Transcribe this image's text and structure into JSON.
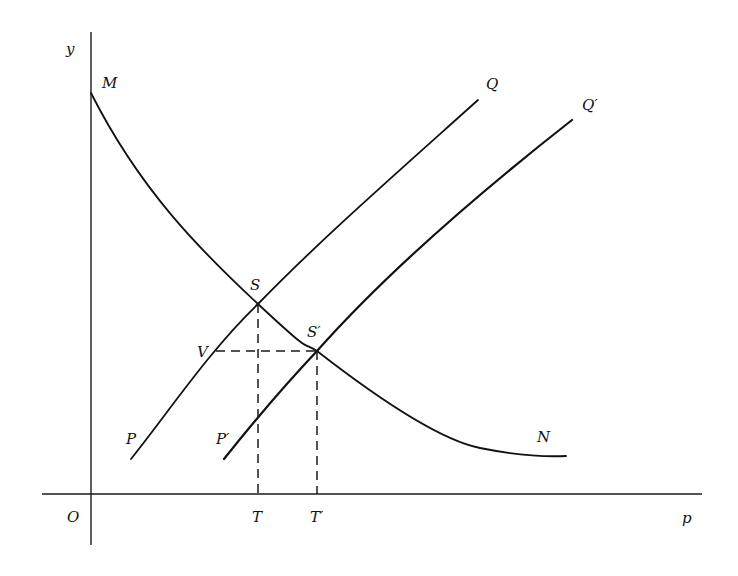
{
  "diagram": {
    "type": "supply-demand shift diagram",
    "axes": {
      "y_label": "y",
      "x_label": "p",
      "origin_label": "O"
    },
    "curves": {
      "demand": {
        "start_label": "M",
        "end_label": "N"
      },
      "supply_original": {
        "start_label": "P",
        "end_label": "Q"
      },
      "supply_shifted": {
        "start_label": "P′",
        "end_label": "Q′"
      }
    },
    "points": {
      "equilibrium_original": "S",
      "equilibrium_shifted": "S′",
      "horizontal_projection": "V",
      "foot_original": "T",
      "foot_shifted": "T′"
    },
    "colors": {
      "ink": "#111111",
      "background": "#ffffff"
    }
  }
}
